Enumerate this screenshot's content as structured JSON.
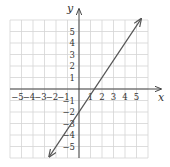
{
  "chart_data": {
    "type": "line",
    "title": "",
    "xlabel": "x",
    "ylabel": "y",
    "xlim": [
      -6,
      6
    ],
    "ylim": [
      -6,
      6
    ],
    "grid": true,
    "x_ticks": [
      -5,
      -4,
      -3,
      -2,
      -1,
      1,
      2,
      3,
      4,
      5
    ],
    "y_ticks": [
      -5,
      -4,
      -3,
      -2,
      -1,
      1,
      2,
      3,
      4,
      5
    ],
    "series": [
      {
        "name": "y = 1.5x - 2",
        "equation": "y = 1.5x - 2",
        "slope": 1.5,
        "intercept": -2,
        "x": [
          -2.6,
          5.4
        ],
        "y": [
          -5.9,
          6.1
        ],
        "arrows": "both",
        "color": "#555555"
      }
    ]
  },
  "colors": {
    "grid": "#d4d4d4",
    "axis": "#444444",
    "line": "#555555",
    "text": "#333333"
  }
}
